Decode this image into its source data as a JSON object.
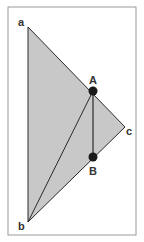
{
  "colors": {
    "frame": "#9a9a9a",
    "fill": "#c8c8c8",
    "stroke": "#2a2a2a",
    "point": "#1a1a1a"
  },
  "labels": {
    "a": "a",
    "b": "b",
    "c": "c",
    "A": "A",
    "B": "B"
  },
  "points": {
    "a": [
      28,
      27
    ],
    "b": [
      28,
      222
    ],
    "c": [
      125,
      127
    ],
    "A": [
      93,
      91
    ],
    "B": [
      93,
      157
    ]
  }
}
